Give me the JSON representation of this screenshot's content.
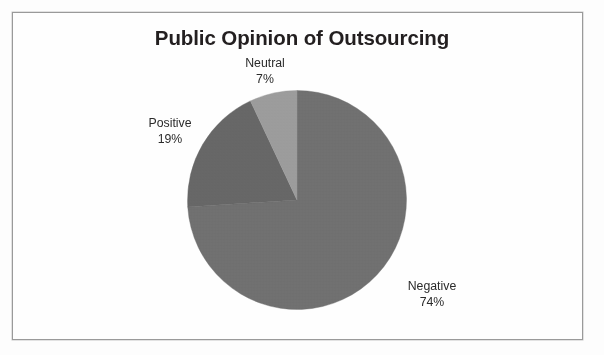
{
  "chart_data": {
    "type": "pie",
    "title": "Public Opinion of Outsourcing",
    "categories": [
      "Negative",
      "Positive",
      "Neutral"
    ],
    "values": [
      74,
      19,
      7
    ],
    "value_unit": "%",
    "start_angle_deg": 0,
    "direction": "clockwise",
    "legend": "none",
    "labels_position": "outside",
    "slices": [
      {
        "name": "Negative",
        "value": 74,
        "label_pct": "74%",
        "color": "#6e6e6e",
        "start_deg": 0.0,
        "end_deg": 266.4
      },
      {
        "name": "Positive",
        "value": 19,
        "label_pct": "19%",
        "color": "#656565",
        "start_deg": 266.4,
        "end_deg": 334.8
      },
      {
        "name": "Neutral",
        "value": 7,
        "label_pct": "7%",
        "color": "#9a9a9a",
        "start_deg": 334.8,
        "end_deg": 360.0
      }
    ],
    "xlabel": "",
    "ylabel": "",
    "grid": false
  },
  "frame": {
    "border_color": "#9a9a9a",
    "background_color": "#fefefe"
  },
  "title": {
    "text": "Public Opinion of Outsourcing",
    "color": "#231f20"
  },
  "labels": {
    "neutral": {
      "name": "Neutral",
      "pct": "7%"
    },
    "positive": {
      "name": "Positive",
      "pct": "19%"
    },
    "negative": {
      "name": "Negative",
      "pct": "74%"
    }
  }
}
